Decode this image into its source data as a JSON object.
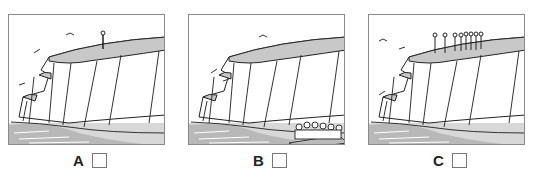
{
  "panels": [
    {
      "id": "A",
      "label": "A",
      "scene": "cliff with one person standing on top",
      "people_on_top": 1,
      "people_on_beach": 0,
      "birds": 3
    },
    {
      "id": "B",
      "label": "B",
      "scene": "cliff with group of people picnicking on beach at cliff base",
      "people_on_top": 0,
      "people_on_beach": 10,
      "birds": 3
    },
    {
      "id": "C",
      "label": "C",
      "scene": "cliff with group of people standing on top",
      "people_on_top": 8,
      "people_on_beach": 0,
      "birds": 3
    }
  ],
  "colors": {
    "cliff_top": "#c8c8c8",
    "sea": "#c4c4c4",
    "line": "#222222",
    "border": "#8a8a8a"
  }
}
